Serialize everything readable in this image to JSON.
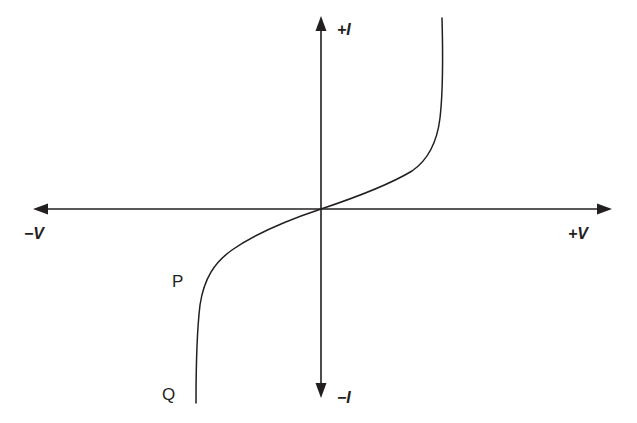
{
  "figure": {
    "background_color": "#ffffff",
    "ink_color": "#231f20",
    "axes": {
      "x_positive_label": "+V",
      "x_negative_label": "−V",
      "y_positive_label": "+I",
      "y_negative_label": "−I",
      "origin_x": 321,
      "origin_y": 209,
      "x_left_end": 33,
      "x_right_end": 612,
      "y_top_end": 16,
      "y_bottom_end": 398
    },
    "annotations": [
      {
        "label": "P",
        "x": 178,
        "y": 284
      },
      {
        "label": "Q",
        "x": 166,
        "y": 398
      }
    ]
  },
  "chart_data": {
    "type": "line",
    "title": "",
    "xlabel": "V",
    "ylabel": "I",
    "grid": false,
    "legend": null,
    "xlim": [
      -1,
      1
    ],
    "ylim": [
      -1,
      1
    ],
    "axis_tick_labels": {
      "x": [
        "−V",
        "+V"
      ],
      "y": [
        "−I",
        "+I"
      ]
    },
    "annotations": [
      {
        "text": "P",
        "note": "knee of the reverse-bias branch, just before breakdown"
      },
      {
        "text": "Q",
        "note": "lower end of the reverse breakdown branch"
      }
    ],
    "series": [
      {
        "name": "I-V characteristic",
        "description": "Symmetric S-shaped curve: shallow linear region through the origin, turning sharply vertical toward a positive-voltage asymptote in quadrant I and a negative-voltage asymptote in quadrant III.",
        "path": "M 196 403 C 196 360, 197 330, 200 305 C 204 278, 215 262, 232 250 C 252 236, 282 222, 321 209 C 360 196, 392 183, 412 171 C 428 160, 437 143, 440 118 C 443 92, 443 55, 442 18",
        "asymptote_positive_v": 443,
        "asymptote_negative_v": 196,
        "points": [
          {
            "x": -0.78,
            "y": -1.0
          },
          {
            "x": -0.77,
            "y": -0.51
          },
          {
            "x": -0.72,
            "y": -0.27
          },
          {
            "x": -0.58,
            "y": -0.15
          },
          {
            "x": -0.3,
            "y": -0.06
          },
          {
            "x": 0.0,
            "y": 0.0
          },
          {
            "x": 0.3,
            "y": 0.06
          },
          {
            "x": 0.58,
            "y": 0.15
          },
          {
            "x": 0.72,
            "y": 0.27
          },
          {
            "x": 0.77,
            "y": 0.51
          },
          {
            "x": 0.78,
            "y": 1.0
          }
        ]
      }
    ]
  }
}
